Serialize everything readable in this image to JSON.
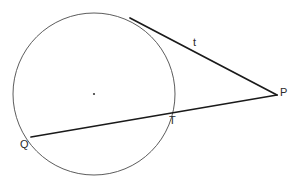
{
  "figure": {
    "kind": "geometry-diagram",
    "width": 301,
    "height": 179,
    "background_color": "#ffffff",
    "stroke_color_thin": "#4a4a4a",
    "stroke_color_bold": "#1a1a1a"
  },
  "circle": {
    "center_x": 94,
    "center_y": 94,
    "radius": 81,
    "center_dot_radius": 1.1
  },
  "points": {
    "P": {
      "x": 277,
      "y": 95
    },
    "Q": {
      "x": 31,
      "y": 137
    },
    "T": {
      "x": 169,
      "y": 111
    },
    "tangent_point": {
      "x": 130,
      "y": 18
    }
  },
  "segments": {
    "tangent": {
      "from": "tangent_point",
      "to": "P",
      "label": "t"
    },
    "secant": {
      "from": "Q",
      "to": "P",
      "through": "T"
    }
  },
  "labels": {
    "P": "P",
    "Q": "Q",
    "T": "T",
    "t": "t"
  }
}
